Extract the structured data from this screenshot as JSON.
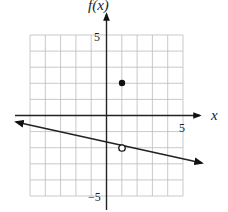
{
  "chart_data": {
    "type": "line",
    "title": "",
    "xlabel": "x",
    "ylabel": "f(x)",
    "xlim": [
      -5,
      5
    ],
    "ylim": [
      -5,
      5
    ],
    "grid": true,
    "x_tick_labels": [
      "5"
    ],
    "y_tick_labels": [
      "5",
      "-5"
    ],
    "series": [
      {
        "name": "line",
        "kind": "line-with-arrows",
        "points": [
          [
            -5.9,
            -0.8
          ],
          [
            6.2,
            -3.25
          ]
        ],
        "equation_approx": "y = -0.2x - 1.8"
      },
      {
        "name": "open-point",
        "kind": "hollow-marker",
        "points": [
          [
            1,
            -2
          ]
        ]
      },
      {
        "name": "closed-point",
        "kind": "filled-marker",
        "points": [
          [
            1,
            2
          ]
        ]
      }
    ]
  },
  "labels": {
    "x_axis": "x",
    "y_axis": "f(x)",
    "x_tick": "5",
    "y_tick_top": "5",
    "y_tick_bottom": "−5"
  }
}
